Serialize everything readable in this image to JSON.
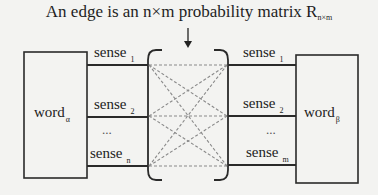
{
  "title": {
    "text": "An edge is an n×m probability matrix R",
    "subscript": "n×m"
  },
  "left_node": {
    "word": "word",
    "subscript": "α",
    "senses": [
      {
        "label": "sense",
        "subscript": "1"
      },
      {
        "label": "sense",
        "subscript": "2"
      },
      {
        "label": "sense",
        "subscript": "n"
      }
    ],
    "ellipsis": "..."
  },
  "right_node": {
    "word": "word",
    "subscript": "β",
    "senses": [
      {
        "label": "sense",
        "subscript": "1"
      },
      {
        "label": "sense",
        "subscript": "2"
      },
      {
        "label": "sense",
        "subscript": "m"
      }
    ],
    "ellipsis": "..."
  },
  "colors": {
    "background": "#f3f3f1",
    "line": "#2a2a2a",
    "dashed": "#8a8a8a"
  }
}
